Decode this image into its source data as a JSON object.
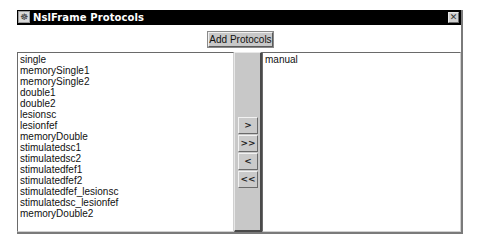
{
  "window": {
    "title": "NslFrame Protocols",
    "icon": "app-icon",
    "close_glyph": "✕"
  },
  "toolbar": {
    "add_protocols_label": "Add Protocols"
  },
  "available_list": {
    "items": [
      "single",
      "memorySingle1",
      "memorySingle2",
      "double1",
      "double2",
      "lesionsc",
      "lesionfef",
      "memoryDouble",
      "stimulatedsc1",
      "stimulatedsc2",
      "stimulatedfef1",
      "stimulatedfef2",
      "stimulatedfef_lesionsc",
      "stimulatedsc_lesionfef",
      "memoryDouble2"
    ]
  },
  "selected_list": {
    "items": [
      "manual"
    ]
  },
  "transfer_buttons": {
    "add_one": ">",
    "add_all": ">>",
    "remove_one": "<",
    "remove_all": "<<"
  }
}
